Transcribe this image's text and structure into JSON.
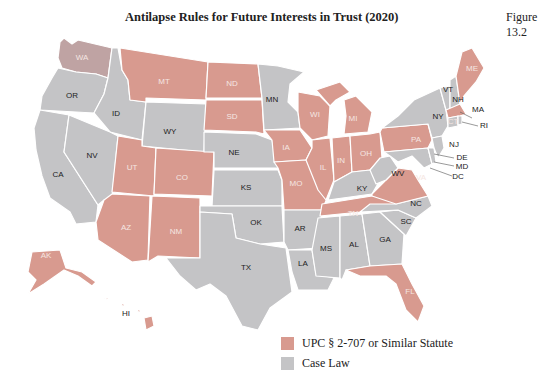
{
  "header": {
    "title": "Antilapse Rules for Future Interests in Trust (2020)",
    "figure_label": "Figure 13.2"
  },
  "colors": {
    "upc": "#d89a8f",
    "case_law": "#c4c4c6",
    "wa": "#bfa3a3",
    "label_light": "#f5e6e2",
    "label_dark": "#222222"
  },
  "legend": {
    "items": [
      {
        "label": "UPC § 2-707 or Similar Statute",
        "category": "upc"
      },
      {
        "label": "Case Law",
        "category": "case_law"
      }
    ]
  },
  "states": {
    "upc": [
      "WA",
      "MT",
      "ND",
      "SD",
      "UT",
      "CO",
      "AZ",
      "NM",
      "IA",
      "MO",
      "WI",
      "IL",
      "MI",
      "IN",
      "OH",
      "PA",
      "TN",
      "VA",
      "FL",
      "ME",
      "MA",
      "AK",
      "HI"
    ],
    "case_law": [
      "OR",
      "ID",
      "WY",
      "CA",
      "NV",
      "NE",
      "KS",
      "OK",
      "TX",
      "MN",
      "AR",
      "LA",
      "MS",
      "AL",
      "GA",
      "SC",
      "NC",
      "KY",
      "WV",
      "NY",
      "VT",
      "NH",
      "CT",
      "RI",
      "NJ",
      "DE",
      "MD",
      "DC"
    ]
  },
  "labels": {
    "WA": "WA",
    "OR": "OR",
    "CA": "CA",
    "ID": "ID",
    "NV": "NV",
    "MT": "MT",
    "WY": "WY",
    "UT": "UT",
    "CO": "CO",
    "AZ": "AZ",
    "NM": "NM",
    "ND": "ND",
    "SD": "SD",
    "NE": "NE",
    "KS": "KS",
    "OK": "OK",
    "TX": "TX",
    "MN": "MN",
    "IA": "IA",
    "MO": "MO",
    "AR": "AR",
    "LA": "LA",
    "WI": "WI",
    "IL": "IL",
    "MI": "MI",
    "IN": "IN",
    "OH": "OH",
    "KY": "KY",
    "TN": "TN",
    "MS": "MS",
    "AL": "AL",
    "GA": "GA",
    "FL": "FL",
    "SC": "SC",
    "NC": "NC",
    "VA": "VA",
    "WV": "WV",
    "PA": "PA",
    "NY": "NY",
    "VT": "VT",
    "NH": "NH",
    "ME": "ME",
    "MA": "MA",
    "CT": "CT",
    "RI": "RI",
    "NJ": "NJ",
    "DE": "DE",
    "MD": "MD",
    "DC": "DC",
    "AK": "AK",
    "HI": "HI"
  }
}
